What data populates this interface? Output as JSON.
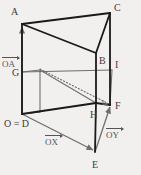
{
  "figure": {
    "background_color": "#f2f0ee",
    "edge_color_solid": "#1a1a1a",
    "edge_color_gray": "#6e6e6e",
    "label_color": "#3c3c3c",
    "vector_color": "#555555",
    "width": 141,
    "height": 175
  },
  "vertex_labels": {
    "A": "A",
    "B": "B",
    "C": "C",
    "E": "E",
    "F": "F",
    "G": "G",
    "H": "H",
    "I": "I",
    "OD": "O = D"
  },
  "vector_labels": {
    "OA": "OA",
    "OX": "OX",
    "OY": "OY"
  },
  "points": {
    "A": {
      "x": 22,
      "y": 24
    },
    "B": {
      "x": 96,
      "y": 53
    },
    "C": {
      "x": 110,
      "y": 13
    },
    "D": {
      "x": 22,
      "y": 114
    },
    "E": {
      "x": 95,
      "y": 152
    },
    "F": {
      "x": 110,
      "y": 105
    },
    "G": {
      "x": 22,
      "y": 72
    },
    "H": {
      "x": 96,
      "y": 103
    },
    "I": {
      "x": 112,
      "y": 70
    },
    "K": {
      "x": 40,
      "y": 70
    },
    "L": {
      "x": 40,
      "y": 112
    }
  }
}
